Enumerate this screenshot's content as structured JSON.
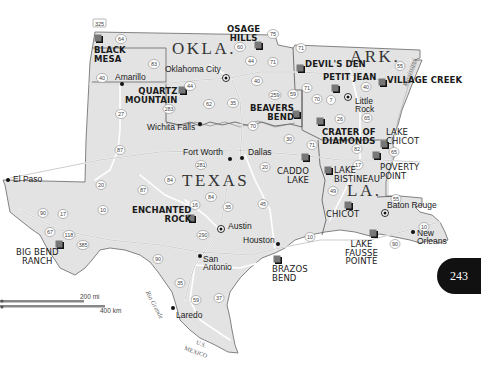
{
  "states": [
    {
      "id": "okla",
      "label": "OKLA."
    },
    {
      "id": "ark",
      "label": "ARK."
    },
    {
      "id": "texas",
      "label": "TEXAS"
    },
    {
      "id": "la",
      "label": "LA."
    }
  ],
  "parks": [
    {
      "id": "black-mesa",
      "line1": "BLACK",
      "line2": "MESA"
    },
    {
      "id": "osage-hills",
      "line1": "OSAGE",
      "line2": "HILLS"
    },
    {
      "id": "quartz-mountain",
      "line1": "QUARTZ",
      "line2": "MOUNTAIN"
    },
    {
      "id": "devils-den",
      "line1": "DEVIL'S DEN"
    },
    {
      "id": "petit-jean",
      "line1": "PETIT JEAN"
    },
    {
      "id": "village-creek",
      "line1": "VILLAGE CREEK"
    },
    {
      "id": "beavers-bend",
      "line1": "BEAVERS",
      "line2": "BEND"
    },
    {
      "id": "crater-of-diamonds",
      "line1": "CRATER OF",
      "line2": "DIAMONDS"
    },
    {
      "id": "lake-chicot",
      "line1": "LAKE",
      "line2": "CHICOT"
    },
    {
      "id": "poverty-point",
      "line1": "POVERTY",
      "line2": "POINT"
    },
    {
      "id": "caddo-lake",
      "line1": "CADDO",
      "line2": "LAKE"
    },
    {
      "id": "lake-bistineau",
      "line1": "LAKE",
      "line2": "BISTINEAU"
    },
    {
      "id": "chicot",
      "line1": "CHICOT"
    },
    {
      "id": "enchanted-rock",
      "line1": "ENCHANTED",
      "line2": "ROCK"
    },
    {
      "id": "big-bend-ranch",
      "line1": "BIG BEND",
      "line2": "RANCH"
    },
    {
      "id": "brazos-bend",
      "line1": "BRAZOS",
      "line2": "BEND"
    },
    {
      "id": "lake-fausse-pointe",
      "line1": "LAKE",
      "line2": "FAUSSE",
      "line3": "POINTE"
    }
  ],
  "cities": [
    {
      "id": "amarillo",
      "label": "Amarillo"
    },
    {
      "id": "oklahoma-city",
      "label": "Oklahoma City",
      "capital": true
    },
    {
      "id": "wichita-falls",
      "label": "Wichita Falls"
    },
    {
      "id": "little-rock",
      "line1": "Little",
      "line2": "Rock",
      "capital": true
    },
    {
      "id": "fort-worth",
      "label": "Fort Worth"
    },
    {
      "id": "dallas",
      "label": "Dallas"
    },
    {
      "id": "el-paso",
      "label": "El Paso"
    },
    {
      "id": "austin",
      "label": "Austin",
      "capital": true
    },
    {
      "id": "houston",
      "label": "Houston"
    },
    {
      "id": "san-antonio",
      "line1": "San",
      "line2": "Antonio"
    },
    {
      "id": "baton-rouge",
      "label": "Baton Rouge",
      "capital": true
    },
    {
      "id": "new-orleans",
      "line1": "New",
      "line2": "Orleans"
    },
    {
      "id": "laredo",
      "label": "Laredo"
    }
  ],
  "highways": [
    "325",
    "64",
    "83",
    "40",
    "27",
    "287",
    "44",
    "62",
    "283",
    "60",
    "75",
    "35",
    "44",
    "40",
    "259",
    "59",
    "70",
    "7",
    "71",
    "30",
    "71",
    "20",
    "26",
    "55",
    "65",
    "82",
    "17",
    "49",
    "45",
    "10",
    "87",
    "20",
    "84",
    "16",
    "84",
    "35",
    "290",
    "10",
    "90",
    "17",
    "67",
    "118",
    "385",
    "90",
    "35",
    "59",
    "37",
    "55",
    "10",
    "90",
    "281"
  ],
  "rivers": {
    "mississippi": "Mississippi",
    "rio_grande": "Rio Grande"
  },
  "border_labels": {
    "us": "U.S.",
    "mexico": "MEXICO"
  },
  "scale": {
    "miles": "200 mi",
    "km": "400 km"
  },
  "page_number": "243",
  "colors": {
    "land": "#e4e4e4",
    "land_shade": "#d2d2d2",
    "water": "#ffffff",
    "park_marker": "#4a4a4a",
    "road": "#ffffff",
    "road_edge": "#9a9a9a",
    "border": "#555555",
    "page_badge": "#111111"
  }
}
